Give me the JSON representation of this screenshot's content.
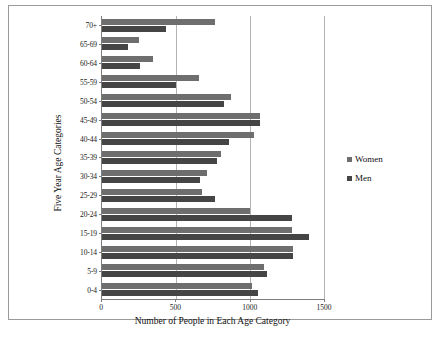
{
  "chart_data": {
    "type": "bar",
    "orientation": "horizontal",
    "title": "",
    "xlabel": "Number of People in Each Age Category",
    "ylabel": "Five Year Age Categories",
    "xlim": [
      0,
      1500
    ],
    "xticks": [
      0,
      500,
      1000,
      1500
    ],
    "xtick_labels": [
      "0",
      "500",
      "1000",
      "1500"
    ],
    "grid": "vertical",
    "legend_position": "right",
    "categories": [
      "70+",
      "65-69",
      "60-64",
      "55-59",
      "50-54",
      "45-49",
      "40-44",
      "35-39",
      "30-34",
      "25-29",
      "20-24",
      "15-19",
      "10-14",
      "5-9",
      "0-4"
    ],
    "series": [
      {
        "name": "Women",
        "color": "#6e6e6e",
        "values": [
          765,
          250,
          345,
          655,
          870,
          1065,
          1030,
          805,
          710,
          675,
          1000,
          1285,
          1290,
          1095,
          1015
        ]
      },
      {
        "name": "Men",
        "color": "#454545",
        "values": [
          430,
          175,
          255,
          500,
          825,
          1065,
          855,
          775,
          665,
          765,
          1285,
          1400,
          1290,
          1115,
          1055
        ]
      }
    ]
  },
  "legend": {
    "items": [
      {
        "label": "Women"
      },
      {
        "label": "Men"
      }
    ]
  },
  "caption": {
    "text": ""
  }
}
